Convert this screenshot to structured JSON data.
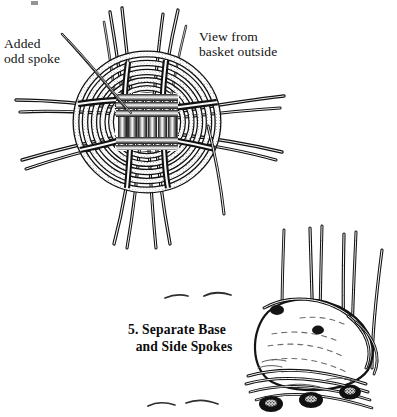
{
  "page": {
    "background_color": "#ffffff",
    "ink_color": "#111111",
    "width": 397,
    "height": 417,
    "kind": "line-art-instructional-illustration"
  },
  "labels": {
    "added_odd_spoke": "Added\nodd spoke",
    "view_from_basket_outside": "View from\nbasket outside"
  },
  "caption": {
    "number": "5.",
    "line1": "5. Separate Base",
    "line2": "and Side Spokes",
    "full_text": "5. Separate Base and Side Spokes"
  },
  "figures": [
    {
      "name": "woven-base-top-view",
      "description": "Circular woven basket base seen from outside with concentric weaver rings, a square cross-woven core, and spoke bundles radiating out at top, bottom, left and right",
      "center": [
        147,
        122
      ],
      "outer_radius": 72,
      "ring_count": 6,
      "core": {
        "x": 118,
        "y": 96,
        "width": 58,
        "height": 52
      },
      "spoke_groups": [
        {
          "name": "spoke-bundle-top-left",
          "angle_deg": 255,
          "strands": 3
        },
        {
          "name": "spoke-bundle-top-right",
          "angle_deg": 285,
          "strands": 3
        },
        {
          "name": "spoke-bundle-left-upper",
          "angle_deg": 175,
          "strands": 3
        },
        {
          "name": "spoke-bundle-left-lower",
          "angle_deg": 192,
          "strands": 3
        },
        {
          "name": "spoke-bundle-right-upper",
          "angle_deg": 8,
          "strands": 3
        },
        {
          "name": "spoke-bundle-right-lower",
          "angle_deg": 350,
          "strands": 3
        },
        {
          "name": "spoke-bundle-bottom-left",
          "angle_deg": 100,
          "strands": 3
        },
        {
          "name": "spoke-bundle-bottom-right",
          "angle_deg": 78,
          "strands": 3
        },
        {
          "name": "added-odd-spoke",
          "angle_deg": 218,
          "strands": 1
        },
        {
          "name": "loose-spoke-right-down",
          "angle_deg": 60,
          "strands": 1
        }
      ]
    },
    {
      "name": "side-spokes-upright",
      "description": "Perspective view of basket base edge with five side spokes bent upright from the twined rim, and dark knot clusters along the bottom border",
      "bounds": {
        "x": 248,
        "y": 218,
        "width": 148,
        "height": 198
      },
      "upright_spoke_count": 5,
      "rim_knot_count": 3
    }
  ],
  "marks": {
    "dash_hints": [
      {
        "name": "dash-hint-left",
        "x": 172,
        "y": 297
      },
      {
        "name": "dash-hint-right",
        "x": 213,
        "y": 296
      },
      {
        "name": "dash-hint-lower",
        "x": 155,
        "y": 404
      },
      {
        "name": "dash-hint-lower2",
        "x": 195,
        "y": 401
      }
    ]
  }
}
